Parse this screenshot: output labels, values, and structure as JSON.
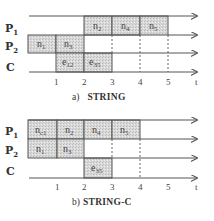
{
  "panels": [
    {
      "id": "a",
      "caption_prefix": "a)",
      "caption_title": "STRING",
      "rows": [
        {
          "label": "P",
          "sub": "1"
        },
        {
          "label": "P",
          "sub": "2"
        },
        {
          "label": "C",
          "sub": ""
        }
      ],
      "ticks": [
        "1",
        "2",
        "3",
        "4",
        "5"
      ],
      "axis_label": "t",
      "tasks": [
        {
          "row": "P1",
          "start": 2,
          "end": 3,
          "label": "n",
          "sub": "2"
        },
        {
          "row": "P1",
          "start": 3,
          "end": 4,
          "label": "n",
          "sub": "4"
        },
        {
          "row": "P1",
          "start": 4,
          "end": 5,
          "label": "n",
          "sub": "5"
        },
        {
          "row": "P2",
          "start": 0,
          "end": 1,
          "label": "n",
          "sub": "1"
        },
        {
          "row": "P2",
          "start": 1,
          "end": 2,
          "label": "n",
          "sub": "3"
        },
        {
          "row": "C",
          "start": 1,
          "end": 2,
          "label": "e",
          "sub": "12"
        },
        {
          "row": "C",
          "start": 2,
          "end": 3,
          "label": "e",
          "sub": "35"
        }
      ]
    },
    {
      "id": "b",
      "caption_prefix": "b)",
      "caption_title": "STRING-C",
      "rows": [
        {
          "label": "P",
          "sub": "1"
        },
        {
          "label": "P",
          "sub": "2"
        },
        {
          "label": "C",
          "sub": ""
        }
      ],
      "ticks": [
        "1",
        "2",
        "3",
        "4",
        "5"
      ],
      "axis_label": "t",
      "tasks": [
        {
          "row": "P1",
          "start": 0,
          "end": 1,
          "label": "n",
          "sub": "c1"
        },
        {
          "row": "P1",
          "start": 1,
          "end": 2,
          "label": "n",
          "sub": "2"
        },
        {
          "row": "P1",
          "start": 2,
          "end": 3,
          "label": "n",
          "sub": "4"
        },
        {
          "row": "P1",
          "start": 3,
          "end": 4,
          "label": "n",
          "sub": "5"
        },
        {
          "row": "P2",
          "start": 0,
          "end": 1,
          "label": "n",
          "sub": "1"
        },
        {
          "row": "P2",
          "start": 1,
          "end": 2,
          "label": "n",
          "sub": "3"
        },
        {
          "row": "C",
          "start": 2,
          "end": 3,
          "label": "e",
          "sub": "35"
        }
      ]
    }
  ]
}
